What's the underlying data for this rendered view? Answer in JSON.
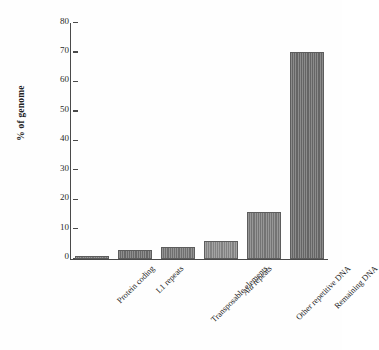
{
  "chart_data": {
    "type": "bar",
    "title": "",
    "subtitle": "",
    "xlabel": "",
    "ylabel": "% of genome",
    "ylim": [
      0,
      80
    ],
    "yticks": [
      0,
      10,
      20,
      30,
      40,
      50,
      60,
      70,
      80
    ],
    "grid": false,
    "legend": "none",
    "categories": [
      "Protein coding",
      "L1 repeats",
      "Transposable elements",
      "Alu repeats",
      "Other repetitive DNA",
      "Remaining DNA"
    ],
    "categories_italic_prefix": [
      "",
      "",
      "",
      "Alu",
      "",
      ""
    ],
    "values": [
      1,
      3,
      4,
      6,
      16,
      70
    ],
    "bar_colors": [
      "#7d7d7d",
      "#6f6f6f",
      "#767676",
      "#8a8a8a",
      "#7a7a7a",
      "#6b6b6b"
    ],
    "bar_edge_color": "#5d5d5d",
    "axis_color": "#4a4a4a",
    "background_color": "#fefefe",
    "text_color": "#232323"
  }
}
